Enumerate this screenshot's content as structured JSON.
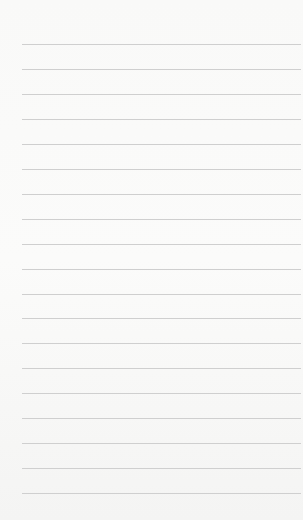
{
  "page": {
    "type": "lined-notepad-page",
    "background_color": "#f8f8f7",
    "line_color": "#cfcfcf",
    "line_count": 19,
    "lines": [
      {
        "text": ""
      },
      {
        "text": ""
      },
      {
        "text": ""
      },
      {
        "text": ""
      },
      {
        "text": ""
      },
      {
        "text": ""
      },
      {
        "text": ""
      },
      {
        "text": ""
      },
      {
        "text": ""
      },
      {
        "text": ""
      },
      {
        "text": ""
      },
      {
        "text": ""
      },
      {
        "text": ""
      },
      {
        "text": ""
      },
      {
        "text": ""
      },
      {
        "text": ""
      },
      {
        "text": ""
      },
      {
        "text": ""
      },
      {
        "text": ""
      }
    ]
  }
}
